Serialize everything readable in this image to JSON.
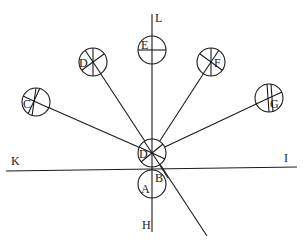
{
  "diagram": {
    "axis_labels": {
      "top": "L",
      "bottom": "H",
      "left": "K",
      "right": "I"
    },
    "circles": [
      {
        "id": "center",
        "label": "D"
      },
      {
        "id": "below",
        "label": "A"
      },
      {
        "id": "top",
        "label": "E"
      },
      {
        "id": "upper-left",
        "label": "D"
      },
      {
        "id": "far-left",
        "label": "C"
      },
      {
        "id": "upper-right",
        "label": "F"
      },
      {
        "id": "far-right",
        "label": "G"
      }
    ],
    "point_labels": {
      "intersection": "B"
    },
    "colors": {
      "stroke": "#1a1a1a",
      "background": "#ffffff"
    }
  }
}
